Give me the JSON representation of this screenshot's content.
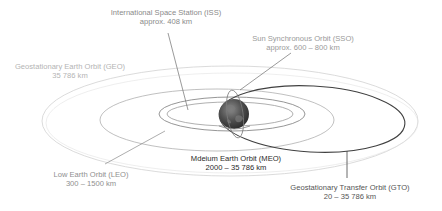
{
  "diagram": {
    "labels": {
      "iss": {
        "name": "International Space Station (ISS)",
        "altitude": "approx. 408 km"
      },
      "sso": {
        "name": "Sun Synchronous Orbit (SSO)",
        "altitude": "approx. 600 – 800 km"
      },
      "geo": {
        "name": "Geostationary Earth Orbit (GEO)",
        "altitude": "35 786 km"
      },
      "leo": {
        "name": "Low Earth Orbit (LEO)",
        "altitude": "300 – 1500 km"
      },
      "meo": {
        "name": "Mdeium Earth Orbit (MEO)",
        "altitude": "2000 – 35 786 km"
      },
      "gto": {
        "name": "Geostationary Transfer Orbit (GTO)",
        "altitude": "20 – 35 786 km"
      }
    },
    "colors": {
      "geo_orbit": "#cfcfcf",
      "meo_orbit": "#a9a9a9",
      "leo_orbit": "#8c8c8c",
      "gto_orbit": "#3c3c3c",
      "leader_line": "#6f6f6f",
      "earth": "#4a4a4a"
    }
  }
}
